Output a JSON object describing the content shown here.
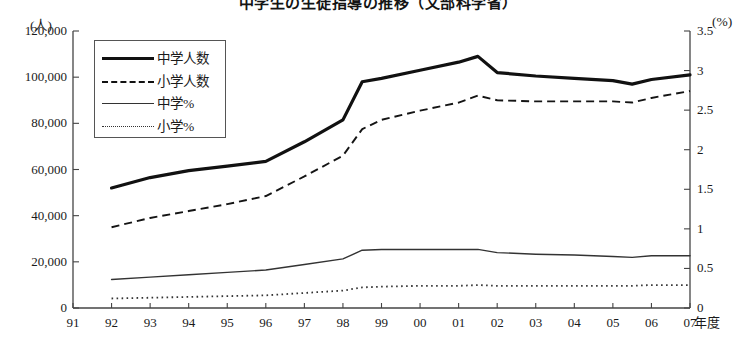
{
  "chart_data": {
    "type": "line",
    "title": "中学生の生徒指導の推移（文部科学省）",
    "xlabel": "年度",
    "ylabel": "(人)",
    "y2label": "(%)",
    "grid": false,
    "legend_position": "top-left",
    "x": [
      "91",
      "92",
      "93",
      "94",
      "95",
      "96",
      "97",
      "98",
      "99",
      "00",
      "01",
      "02",
      "03",
      "04",
      "05",
      "06",
      "07"
    ],
    "xtick_labels": [
      "91",
      "92",
      "93",
      "94",
      "95",
      "96",
      "97",
      "98",
      "99",
      "00",
      "01",
      "02",
      "03",
      "04",
      "05",
      "06",
      "07"
    ],
    "ytick_labels": [
      "0",
      "20,000",
      "40,000",
      "60,000",
      "80,000",
      "100,000",
      "120,000"
    ],
    "ytick_values": [
      0,
      20000,
      40000,
      60000,
      80000,
      100000,
      120000
    ],
    "ylim": [
      0,
      120000
    ],
    "y2tick_labels": [
      "0",
      "0.5",
      "1",
      "1.5",
      "2",
      "2.5",
      "3",
      "3.5"
    ],
    "y2tick_values": [
      0,
      0.5,
      1,
      1.5,
      2,
      2.5,
      3,
      3.5
    ],
    "y2lim": [
      0,
      3.5
    ],
    "series": [
      {
        "name": "中学人数",
        "axis": "left",
        "style": "thick-solid",
        "x": [
          "92",
          "93",
          "94",
          "95",
          "96",
          "97",
          "98",
          "98.5",
          "99",
          "00",
          "01",
          "01.5",
          "02",
          "03",
          "04",
          "05",
          "05.5",
          "06",
          "07"
        ],
        "values": [
          52000,
          56500,
          59500,
          61500,
          63500,
          72000,
          81500,
          98000,
          99500,
          103000,
          106500,
          109000,
          102000,
          100500,
          99500,
          98500,
          97000,
          99000,
          101000
        ]
      },
      {
        "name": "小学人数",
        "axis": "left",
        "style": "dashed",
        "x": [
          "92",
          "93",
          "94",
          "95",
          "96",
          "97",
          "98",
          "98.5",
          "99",
          "00",
          "01",
          "01.5",
          "02",
          "03",
          "04",
          "05",
          "05.5",
          "06",
          "07"
        ],
        "values": [
          35000,
          39000,
          42000,
          45000,
          48500,
          57000,
          66000,
          77500,
          81500,
          85500,
          89000,
          92000,
          90000,
          89500,
          89500,
          89500,
          89000,
          91000,
          94000
        ]
      },
      {
        "name": "中学%",
        "axis": "right",
        "style": "thin-solid",
        "x": [
          "92",
          "93",
          "94",
          "95",
          "96",
          "97",
          "98",
          "98.5",
          "99",
          "00",
          "01",
          "01.5",
          "02",
          "03",
          "04",
          "05",
          "05.5",
          "06",
          "07"
        ],
        "values": [
          0.36,
          0.39,
          0.42,
          0.45,
          0.48,
          0.55,
          0.62,
          0.73,
          0.74,
          0.74,
          0.74,
          0.74,
          0.7,
          0.68,
          0.67,
          0.65,
          0.64,
          0.66,
          0.66
        ]
      },
      {
        "name": "小学%",
        "axis": "right",
        "style": "dotted",
        "x": [
          "92",
          "93",
          "94",
          "95",
          "96",
          "97",
          "98",
          "98.5",
          "99",
          "00",
          "01",
          "01.5",
          "02",
          "03",
          "04",
          "05",
          "05.5",
          "06",
          "07"
        ],
        "values": [
          0.12,
          0.13,
          0.14,
          0.15,
          0.16,
          0.19,
          0.22,
          0.26,
          0.27,
          0.28,
          0.28,
          0.29,
          0.28,
          0.28,
          0.28,
          0.28,
          0.28,
          0.29,
          0.29
        ]
      }
    ],
    "legend": [
      {
        "label": "中学人数",
        "style": "thick-solid"
      },
      {
        "label": "小学人数",
        "style": "dashed"
      },
      {
        "label": "中学%",
        "style": "thin-solid"
      },
      {
        "label": "小学%",
        "style": "dotted"
      }
    ]
  }
}
